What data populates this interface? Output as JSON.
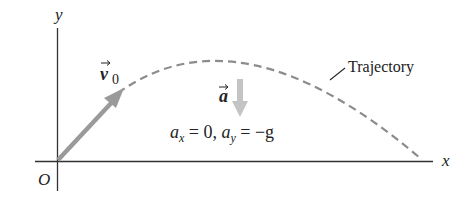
{
  "diagram": {
    "axes": {
      "x_label": "x",
      "y_label": "y",
      "origin_label": "O"
    },
    "initial_velocity": {
      "symbol": "v",
      "subscript": "0"
    },
    "acceleration": {
      "symbol": "a",
      "equation": {
        "ax_sym": "a",
        "ax_sub": "x",
        "ax_val": " = 0, ",
        "ay_sym": "a",
        "ay_sub": "y",
        "ay_val": " = −g"
      }
    },
    "trajectory_label": "Trajectory",
    "colors": {
      "axis": "#333333",
      "velocity_arrow": "#9a9a9a",
      "accel_arrow": "#c4c4c4",
      "trajectory": "#8c8c8c",
      "text": "#222222"
    }
  }
}
